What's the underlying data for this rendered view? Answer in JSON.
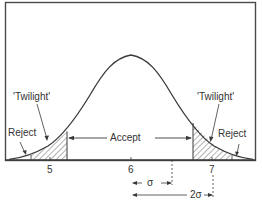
{
  "diagram": {
    "type": "normal-distribution-acceptance-diagram",
    "labels": {
      "twilight_left": "'Twilight'",
      "twilight_right": "'Twilight'",
      "reject_left": "Reject",
      "reject_right": "Reject",
      "accept": "Accept"
    },
    "axis": {
      "ticks": [
        "5",
        "6",
        "7"
      ]
    },
    "dimensions": {
      "sigma": "σ",
      "two_sigma": "2σ"
    },
    "colors": {
      "line": "#3a3a3a",
      "hatch": "#555555",
      "frame": "#4a4a4a",
      "background": "#ffffff"
    }
  }
}
